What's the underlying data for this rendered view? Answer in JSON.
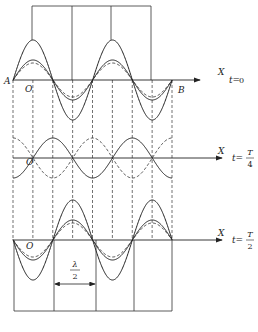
{
  "figure": {
    "type": "standing-wave-formation",
    "panels": [
      {
        "id": "t0",
        "time_label_prefix": "t=",
        "time_label_value": "0",
        "axis_label": "X",
        "origin_label": "O",
        "left_point_label": "A",
        "right_point_label": "B",
        "resultant": "standing wave at maximum displacement",
        "phase_sign": 1
      },
      {
        "id": "tT4",
        "time_label_prefix": "t=",
        "time_label_num": "T",
        "time_label_den": "4",
        "axis_label": "X",
        "origin_label": "O",
        "resultant": "zero displacement (component waves cancel)",
        "phase_sign": 0
      },
      {
        "id": "tT2",
        "time_label_prefix": "t=",
        "time_label_num": "T",
        "time_label_den": "2",
        "axis_label": "X",
        "origin_label": "O",
        "resultant": "standing wave at maximum displacement (inverted)",
        "phase_sign": -1
      }
    ],
    "half_wavelength_label": {
      "num": "λ",
      "den": "2"
    },
    "component_amplitude_ratio": 0.5,
    "resultant_amplitude_ratio": 1.0,
    "wavelengths_shown": 2,
    "colors": {
      "line": "#222222",
      "dashed": "#333333"
    }
  }
}
